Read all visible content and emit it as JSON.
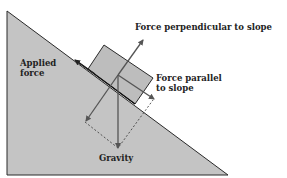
{
  "diagram": {
    "labels": {
      "applied_force_line1": "Applied",
      "applied_force_line2": "force",
      "perpendicular": "Force perpendicular to slope",
      "parallel_line1": "Force parallel",
      "parallel_line2": "to slope",
      "gravity": "Gravity"
    },
    "colors": {
      "slope_fill": "#c4c4c4",
      "block_fill": "#bdbdbd",
      "outline": "#2a2a2a",
      "arrow": "#555555",
      "background": "#ffffff"
    }
  }
}
